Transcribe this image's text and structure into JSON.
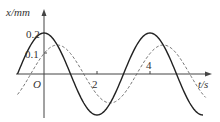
{
  "chart_data": {
    "type": "line",
    "title": "",
    "xlabel": "t/s",
    "ylabel": "x/mm",
    "origin_label": "O",
    "x_ticks": [
      "2",
      "4"
    ],
    "y_ticks": [
      "0.1",
      "0.2"
    ],
    "xlim": [
      -1,
      6
    ],
    "ylim": [
      -0.2,
      0.2
    ],
    "grid": false,
    "legend": null,
    "series": [
      {
        "name": "solid",
        "style": "solid",
        "color": "#222222",
        "equation": "x = 0.2 cos(πt/2)",
        "amplitude": 0.2,
        "period": 4,
        "x": [
          -1,
          0,
          1,
          2,
          3,
          4,
          5,
          6
        ],
        "values": [
          0,
          0.2,
          0,
          -0.2,
          0,
          0.2,
          0,
          -0.2
        ]
      },
      {
        "name": "dashed",
        "style": "dashed",
        "color": "#555555",
        "equation": "x = 0.1√2 sin(πt/2 + π/4)",
        "amplitude": 0.14,
        "period": 4,
        "x": [
          -1,
          0,
          0.5,
          1,
          2,
          3,
          3.5,
          4,
          5,
          6
        ],
        "values": [
          0,
          0.1,
          0.14,
          0.1,
          -0.1,
          -0.1,
          -0.14,
          -0.1,
          0.1,
          0.1
        ]
      }
    ]
  },
  "labels": {
    "y_axis": "x/mm",
    "x_axis": "t/s",
    "origin": "O",
    "y_tick_02": "0.2",
    "y_tick_01": "0.1",
    "x_tick_2": "2",
    "x_tick_4": "4"
  }
}
